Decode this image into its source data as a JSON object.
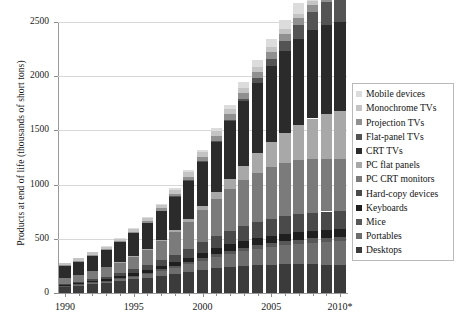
{
  "chart_data": {
    "type": "bar",
    "stacked": true,
    "title": "",
    "xlabel": "",
    "ylabel": "Products at end of life (thousands of short tons)",
    "ylim": [
      0,
      2500
    ],
    "yticks": [
      0,
      500,
      1000,
      1500,
      2000,
      2500
    ],
    "ytick_labels": [
      "0",
      "500",
      "1000",
      "1500",
      "2000",
      "2500"
    ],
    "grid": true,
    "legend_position": "right",
    "x": [
      "1990",
      "1991",
      "1992",
      "1993",
      "1994",
      "1995",
      "1996",
      "1997",
      "1998",
      "1999",
      "2000",
      "2001",
      "2002",
      "2003",
      "2004",
      "2005",
      "2006",
      "2007",
      "2008",
      "2009",
      "2010*"
    ],
    "xtick_labels": [
      "1990",
      "1995",
      "2000",
      "2005",
      "2010*"
    ],
    "xtick_values": [
      "1990",
      "1995",
      "2000",
      "2005",
      "2010*"
    ],
    "series": [
      {
        "name": "Desktops",
        "color": "#3b3b3b",
        "values": [
          62,
          72,
          84,
          96,
          110,
          126,
          143,
          160,
          178,
          196,
          214,
          230,
          243,
          252,
          258,
          262,
          264,
          265,
          264,
          262,
          260
        ]
      },
      {
        "name": "Portables",
        "color": "#6e6e6e",
        "values": [
          4,
          6,
          9,
          13,
          18,
          24,
          32,
          42,
          54,
          68,
          84,
          100,
          116,
          132,
          148,
          163,
          177,
          190,
          202,
          212,
          221
        ]
      },
      {
        "name": "Mice",
        "color": "#585858",
        "values": [
          3,
          4,
          5,
          6,
          8,
          10,
          12,
          15,
          18,
          21,
          25,
          28,
          31,
          33,
          35,
          36,
          37,
          38,
          38,
          38,
          38
        ]
      },
      {
        "name": "Keyboards",
        "color": "#1f1f1f",
        "values": [
          8,
          10,
          12,
          15,
          18,
          22,
          26,
          31,
          36,
          42,
          48,
          53,
          58,
          62,
          65,
          67,
          69,
          70,
          70,
          70,
          70
        ]
      },
      {
        "name": "Hard-copy devices",
        "color": "#4a4a4a",
        "values": [
          10,
          13,
          17,
          22,
          28,
          36,
          45,
          56,
          68,
          82,
          97,
          111,
          124,
          136,
          146,
          154,
          160,
          165,
          168,
          170,
          171
        ]
      },
      {
        "name": "PC CRT monitors",
        "color": "#7b7b7b",
        "values": [
          52,
          62,
          74,
          88,
          104,
          124,
          148,
          176,
          210,
          250,
          296,
          342,
          386,
          424,
          454,
          476,
          490,
          496,
          494,
          486,
          474
        ]
      },
      {
        "name": "PC flat panels",
        "color": "#a8a8a8",
        "values": [
          0,
          0,
          0,
          0,
          1,
          2,
          4,
          8,
          14,
          24,
          40,
          64,
          96,
          136,
          182,
          232,
          282,
          330,
          374,
          412,
          444
        ]
      },
      {
        "name": "CRT TVs",
        "color": "#2b2b2b",
        "values": [
          112,
          126,
          142,
          160,
          182,
          208,
          238,
          272,
          312,
          358,
          410,
          468,
          530,
          592,
          652,
          706,
          752,
          788,
          812,
          824,
          826
        ]
      },
      {
        "name": "Flat-panel TVs",
        "color": "#545454",
        "values": [
          0,
          0,
          0,
          0,
          0,
          0,
          0,
          0,
          1,
          2,
          4,
          8,
          14,
          24,
          40,
          62,
          92,
          128,
          170,
          214,
          258
        ]
      },
      {
        "name": "Projection TVs",
        "color": "#909090",
        "values": [
          4,
          5,
          6,
          8,
          10,
          13,
          16,
          20,
          25,
          31,
          38,
          45,
          52,
          58,
          63,
          66,
          68,
          68,
          66,
          62,
          58
        ]
      },
      {
        "name": "Monochrome TVs",
        "color": "#c4c4c4",
        "values": [
          22,
          24,
          26,
          28,
          30,
          32,
          34,
          36,
          38,
          40,
          42,
          43,
          44,
          44,
          44,
          43,
          42,
          40,
          38,
          36,
          34
        ]
      },
      {
        "name": "Mobile devices",
        "color": "#dcdcdc",
        "values": [
          0,
          0,
          0,
          1,
          2,
          3,
          5,
          8,
          12,
          17,
          24,
          32,
          42,
          53,
          65,
          77,
          88,
          98,
          106,
          112,
          117
        ]
      }
    ]
  },
  "legend": {
    "items": [
      {
        "label": "Mobile devices",
        "color": "#dcdcdc"
      },
      {
        "label": "Monochrome TVs",
        "color": "#c4c4c4"
      },
      {
        "label": "Projection TVs",
        "color": "#909090"
      },
      {
        "label": "Flat-panel TVs",
        "color": "#545454"
      },
      {
        "label": "CRT TVs",
        "color": "#2b2b2b"
      },
      {
        "label": "PC flat panels",
        "color": "#a8a8a8"
      },
      {
        "label": "PC CRT monitors",
        "color": "#7b7b7b"
      },
      {
        "label": "Hard-copy devices",
        "color": "#4a4a4a"
      },
      {
        "label": "Keyboards",
        "color": "#1f1f1f"
      },
      {
        "label": "Mice",
        "color": "#585858"
      },
      {
        "label": "Portables",
        "color": "#6e6e6e"
      },
      {
        "label": "Desktops",
        "color": "#3b3b3b"
      }
    ]
  }
}
